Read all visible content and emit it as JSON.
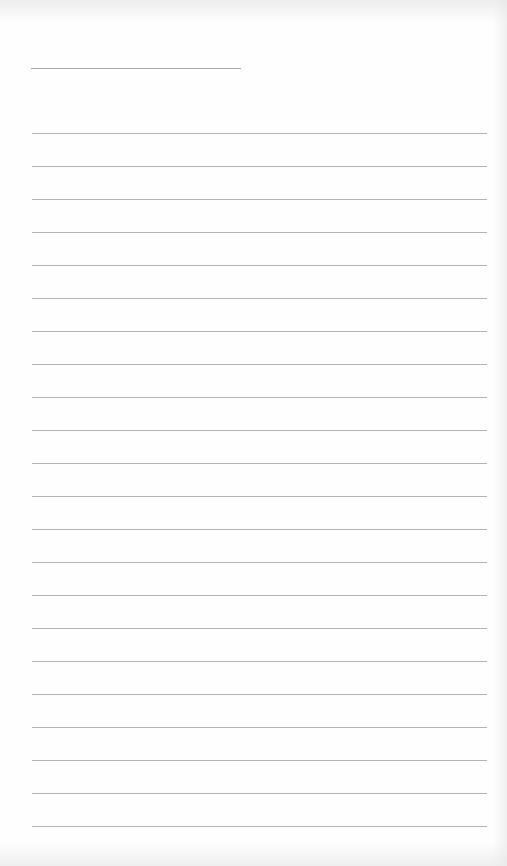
{
  "document": {
    "type": "lined-paper",
    "background_color": "#fefefe",
    "line_color": "#b4b4b4",
    "header_line": {
      "label": "",
      "top": 68,
      "left": 31,
      "width": 210
    },
    "ruled_lines": {
      "count": 22,
      "first_top": 133,
      "spacing": 33,
      "left": 32,
      "width": 455,
      "entries": [
        "",
        "",
        "",
        "",
        "",
        "",
        "",
        "",
        "",
        "",
        "",
        "",
        "",
        "",
        "",
        "",
        "",
        "",
        "",
        "",
        "",
        ""
      ]
    }
  }
}
